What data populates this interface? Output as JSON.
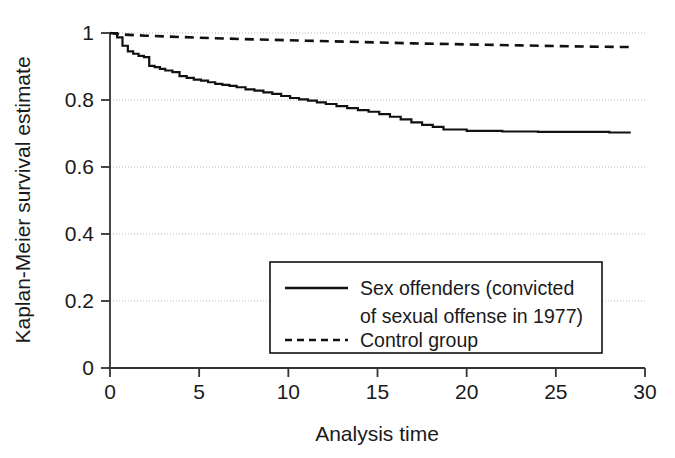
{
  "chart_data": {
    "type": "line",
    "title": "",
    "xlabel": "Analysis time",
    "ylabel": "Kaplan-Meier survival estimate",
    "xlim": [
      0,
      30
    ],
    "ylim": [
      0,
      1
    ],
    "xticks": [
      0,
      5,
      10,
      15,
      20,
      25,
      30
    ],
    "xtick_labels": [
      "0",
      "5",
      "10",
      "15",
      "20",
      "25",
      "30"
    ],
    "yticks": [
      0,
      0.2,
      0.4,
      0.6,
      0.8,
      1
    ],
    "ytick_labels": [
      "0",
      "0.2",
      "0.4",
      "0.6",
      "0.8",
      "1"
    ],
    "grid": true,
    "grid_axis": "y",
    "grid_style": "dotted",
    "legend_position": "lower-center-right",
    "line_color": "#111111",
    "grid_color": "#b8b8b8",
    "axis_color": "#333333",
    "step_interpolation": "post",
    "series": [
      {
        "name": "Sex offenders (convicted of sexual offense in 1977)",
        "style": "solid",
        "x": [
          0,
          0.4,
          0.7,
          1.0,
          1.3,
          1.6,
          1.9,
          2.2,
          2.5,
          2.8,
          3.1,
          3.5,
          3.9,
          4.3,
          4.7,
          5.1,
          5.5,
          5.9,
          6.3,
          6.7,
          7.1,
          7.6,
          8.1,
          8.6,
          9.1,
          9.6,
          10.1,
          10.6,
          11.1,
          11.6,
          12.1,
          12.7,
          13.3,
          13.9,
          14.5,
          15.1,
          15.7,
          16.3,
          16.9,
          17.5,
          18.1,
          18.7,
          20.0,
          22.0,
          24.0,
          26.0,
          28.0,
          29.2
        ],
        "y": [
          1.0,
          0.987,
          0.962,
          0.945,
          0.938,
          0.932,
          0.928,
          0.902,
          0.898,
          0.893,
          0.888,
          0.883,
          0.871,
          0.866,
          0.861,
          0.858,
          0.853,
          0.848,
          0.845,
          0.842,
          0.838,
          0.832,
          0.828,
          0.823,
          0.818,
          0.812,
          0.806,
          0.802,
          0.798,
          0.793,
          0.788,
          0.782,
          0.776,
          0.77,
          0.765,
          0.758,
          0.75,
          0.742,
          0.733,
          0.726,
          0.72,
          0.712,
          0.708,
          0.706,
          0.705,
          0.705,
          0.703,
          0.703
        ]
      },
      {
        "name": "Control group",
        "style": "dashed",
        "x": [
          0,
          0.5,
          2,
          5,
          8,
          11,
          14,
          17,
          20,
          23,
          26,
          29.2
        ],
        "y": [
          1.0,
          0.996,
          0.992,
          0.986,
          0.981,
          0.977,
          0.973,
          0.969,
          0.966,
          0.963,
          0.96,
          0.958
        ]
      }
    ]
  },
  "legend": {
    "entries": [
      {
        "label_lines": [
          "Sex offenders (convicted",
          "of sexual offense in 1977)"
        ],
        "style": "solid"
      },
      {
        "label_lines": [
          "Control group"
        ],
        "style": "dashed"
      }
    ]
  }
}
